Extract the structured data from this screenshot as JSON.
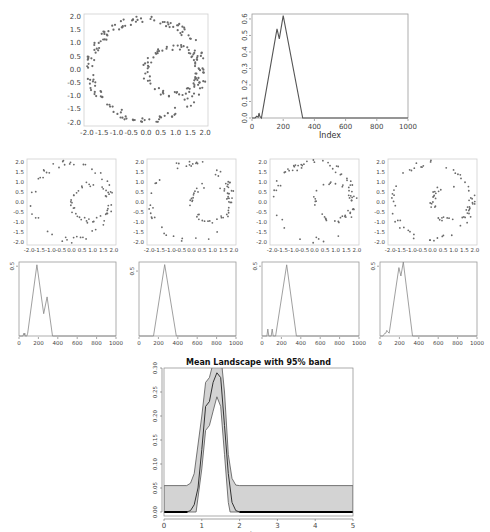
{
  "chart_data": [
    {
      "id": "scatter_main",
      "type": "scatter",
      "title": "",
      "xlabel": "",
      "ylabel": "",
      "xlim": [
        -2.1,
        2.1
      ],
      "ylim": [
        -2.15,
        2.1
      ],
      "xticks": [
        -2.0,
        -1.5,
        -1.0,
        -0.5,
        0.0,
        0.5,
        1.0,
        1.5,
        2.0
      ],
      "yticks": [
        -2.0,
        -1.5,
        -1.0,
        -0.5,
        0.0,
        0.5,
        1.0,
        1.5,
        2.0
      ],
      "description": "Two noisy circles: outer ring radius ~1.9 centered at (0,0), inner ring radius ~0.9 centered at (0.9,0)",
      "rings": [
        {
          "cx": 0.0,
          "cy": 0.0,
          "r": 1.9,
          "n": 150,
          "noise": 0.08
        },
        {
          "cx": 0.9,
          "cy": -0.05,
          "r": 0.9,
          "n": 80,
          "noise": 0.06
        }
      ],
      "seed": 3
    },
    {
      "id": "landscape_main",
      "type": "line",
      "title": "",
      "xlabel": "Index",
      "ylabel": "",
      "xlim": [
        0,
        1000
      ],
      "ylim": [
        0,
        0.63
      ],
      "xticks": [
        0,
        200,
        400,
        600,
        800,
        1000
      ],
      "yticks": [
        0.0,
        0.1,
        0.2,
        0.3,
        0.4,
        0.5,
        0.6
      ],
      "x": [
        0,
        20,
        30,
        40,
        45,
        50,
        55,
        60,
        160,
        175,
        200,
        325,
        1000
      ],
      "values": [
        0,
        0,
        0.01,
        0.005,
        0.03,
        0.01,
        0.005,
        0,
        0.54,
        0.48,
        0.62,
        0,
        0
      ]
    },
    {
      "id": "scatter_1",
      "type": "scatter",
      "xlim": [
        -2.1,
        2.1
      ],
      "ylim": [
        -2.15,
        2.1
      ],
      "xticks": [
        -2.0,
        -1.5,
        -1.0,
        -0.5,
        0.0,
        0.5,
        1.0,
        1.5,
        2.0
      ],
      "yticks": [
        -2.0,
        -1.5,
        -1.0,
        -0.5,
        0.0,
        0.5,
        1.0,
        1.5,
        2.0
      ],
      "rings": [
        {
          "cx": 0.0,
          "cy": 0.0,
          "r": 1.9,
          "n": 50,
          "noise": 0.08
        },
        {
          "cx": 0.9,
          "cy": -0.05,
          "r": 0.9,
          "n": 40,
          "noise": 0.06
        }
      ],
      "seed": 11
    },
    {
      "id": "scatter_2",
      "type": "scatter",
      "xlim": [
        -2.1,
        2.1
      ],
      "ylim": [
        -2.15,
        2.1
      ],
      "xticks": [
        -2.0,
        -1.5,
        -1.0,
        -0.5,
        0.0,
        0.5,
        1.0,
        1.5,
        2.0
      ],
      "yticks": [
        -2.0,
        -1.5,
        -1.0,
        -0.5,
        0.0,
        0.5,
        1.0,
        1.5,
        2.0
      ],
      "rings": [
        {
          "cx": 0.0,
          "cy": 0.0,
          "r": 1.9,
          "n": 50,
          "noise": 0.08
        },
        {
          "cx": 0.9,
          "cy": -0.05,
          "r": 0.9,
          "n": 40,
          "noise": 0.06
        }
      ],
      "seed": 23
    },
    {
      "id": "scatter_3",
      "type": "scatter",
      "xlim": [
        -2.1,
        2.1
      ],
      "ylim": [
        -2.15,
        2.1
      ],
      "xticks": [
        -2.0,
        -1.5,
        -1.0,
        -0.5,
        0.0,
        0.5,
        1.0,
        1.5,
        2.0
      ],
      "yticks": [
        -2.0,
        -1.5,
        -1.0,
        -0.5,
        0.0,
        0.5,
        1.0,
        1.5,
        2.0
      ],
      "rings": [
        {
          "cx": 0.0,
          "cy": 0.0,
          "r": 1.9,
          "n": 50,
          "noise": 0.08
        },
        {
          "cx": 0.9,
          "cy": -0.05,
          "r": 0.9,
          "n": 40,
          "noise": 0.06
        }
      ],
      "seed": 37
    },
    {
      "id": "scatter_4",
      "type": "scatter",
      "xlim": [
        -2.1,
        2.1
      ],
      "ylim": [
        -2.15,
        2.1
      ],
      "xticks": [
        -2.0,
        -1.5,
        -1.0,
        -0.5,
        0.0,
        0.5,
        1.0,
        1.5,
        2.0
      ],
      "yticks": [
        -2.0,
        -1.5,
        -1.0,
        -0.5,
        0.0,
        0.5,
        1.0,
        1.5,
        2.0
      ],
      "rings": [
        {
          "cx": 0.0,
          "cy": 0.0,
          "r": 1.9,
          "n": 50,
          "noise": 0.08
        },
        {
          "cx": 0.9,
          "cy": -0.05,
          "r": 0.9,
          "n": 40,
          "noise": 0.06
        }
      ],
      "seed": 51
    },
    {
      "id": "landscape_1",
      "type": "line",
      "xlim": [
        0,
        1000
      ],
      "ylim": [
        0,
        0.53
      ],
      "xticks": [
        0,
        200,
        400,
        600,
        800,
        1000
      ],
      "yticks": [
        0.0,
        0.1,
        0.2,
        0.3,
        0.4,
        0.5
      ],
      "x": [
        0,
        40,
        50,
        55,
        60,
        65,
        80,
        90,
        185,
        255,
        290,
        345,
        1000
      ],
      "values": [
        0,
        0,
        0.02,
        0.005,
        0.02,
        0,
        0,
        0.02,
        0.51,
        0.16,
        0.28,
        0,
        0
      ]
    },
    {
      "id": "landscape_2",
      "type": "line",
      "xlim": [
        0,
        1000
      ],
      "ylim": [
        0,
        0.57
      ],
      "xticks": [
        0,
        200,
        400,
        600,
        800,
        1000
      ],
      "yticks": [
        0.0,
        0.1,
        0.2,
        0.3,
        0.4,
        0.5
      ],
      "x": [
        0,
        150,
        265,
        385,
        1000
      ],
      "values": [
        0,
        0,
        0.55,
        0,
        0
      ]
    },
    {
      "id": "landscape_3",
      "type": "line",
      "xlim": [
        0,
        1000
      ],
      "ylim": [
        0,
        0.53
      ],
      "xticks": [
        0,
        200,
        400,
        600,
        800,
        1000
      ],
      "yticks": [
        0.0,
        0.1,
        0.2,
        0.3,
        0.4,
        0.5
      ],
      "x": [
        0,
        50,
        60,
        70,
        95,
        105,
        115,
        140,
        255,
        355,
        1000
      ],
      "values": [
        0,
        0,
        0.05,
        0,
        0,
        0.05,
        0,
        0,
        0.51,
        0,
        0
      ]
    },
    {
      "id": "landscape_4",
      "type": "line",
      "xlim": [
        0,
        1000
      ],
      "ylim": [
        0,
        0.53
      ],
      "xticks": [
        0,
        200,
        400,
        600,
        800,
        1000
      ],
      "yticks": [
        0.0,
        0.1,
        0.2,
        0.3,
        0.4,
        0.5
      ],
      "x": [
        0,
        30,
        40,
        50,
        60,
        70,
        80,
        95,
        195,
        215,
        240,
        335,
        1000
      ],
      "values": [
        0,
        0,
        0.01,
        0.02,
        0.02,
        0.04,
        0.03,
        0.02,
        0.49,
        0.43,
        0.53,
        0,
        0
      ]
    },
    {
      "id": "mean_landscape",
      "type": "area",
      "title": "Mean Landscape with 95% band",
      "xlabel": "tseq",
      "ylabel": "",
      "xlim": [
        0,
        5
      ],
      "ylim": [
        0,
        0.3
      ],
      "xticks": [
        0,
        1,
        2,
        3,
        4,
        5
      ],
      "yticks": [
        0.0,
        0.05,
        0.1,
        0.15,
        0.2,
        0.25,
        0.3
      ],
      "ytick_labels": [
        "0.00",
        "0.05",
        "0.10",
        "0.15",
        "0.20",
        "0.25",
        "0.30"
      ],
      "band_upper": {
        "x": [
          0,
          0.0,
          0.6,
          0.7,
          0.8,
          1.0,
          1.1,
          1.2,
          1.3,
          1.4,
          1.5,
          1.6,
          1.7,
          1.8,
          1.9,
          2.0,
          5.0,
          5.0
        ],
        "y": [
          0,
          0.055,
          0.055,
          0.06,
          0.08,
          0.2,
          0.27,
          0.28,
          0.31,
          0.33,
          0.33,
          0.25,
          0.12,
          0.07,
          0.056,
          0.055,
          0.055,
          0
        ]
      },
      "band_lower": {
        "x": [
          0,
          0.85,
          1.0,
          1.1,
          1.2,
          1.3,
          1.4,
          1.5,
          1.6,
          1.7,
          1.75,
          5.0
        ],
        "y": [
          0,
          0,
          0.09,
          0.17,
          0.18,
          0.21,
          0.24,
          0.22,
          0.12,
          0.02,
          0,
          0
        ]
      },
      "mean": {
        "x": [
          0,
          0.6,
          0.7,
          0.8,
          0.9,
          1.0,
          1.1,
          1.2,
          1.3,
          1.4,
          1.5,
          1.6,
          1.7,
          1.8,
          1.9,
          2.0,
          5.0
        ],
        "y": [
          0,
          0,
          0.003,
          0.015,
          0.05,
          0.13,
          0.22,
          0.23,
          0.27,
          0.29,
          0.28,
          0.18,
          0.08,
          0.02,
          0.003,
          0,
          0
        ]
      },
      "zero_line": {
        "x": [
          0,
          5
        ],
        "y": [
          0,
          0
        ]
      },
      "colors": {
        "band": "#d3d3d3",
        "band_edge": "#555555",
        "mean": "#333333",
        "zero": "#000000"
      }
    }
  ]
}
